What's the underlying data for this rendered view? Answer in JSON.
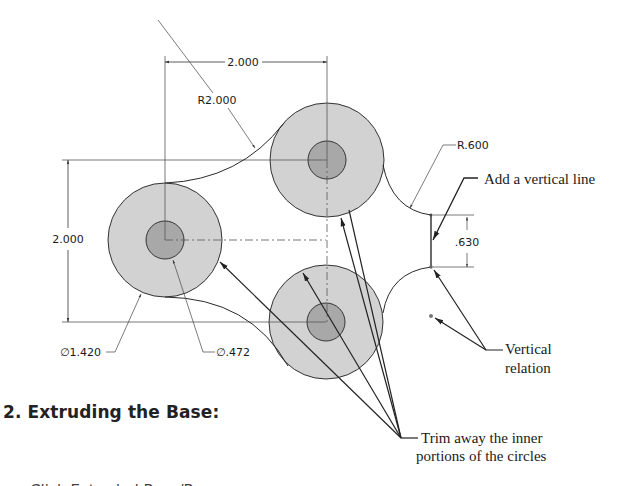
{
  "drawing": {
    "dimensions": {
      "horizontal_spacing": "2.000",
      "vertical_spacing": "2.000",
      "arc_radius_large": "R2.000",
      "arc_radius_small": "R.600",
      "outer_diameter": "∅1.420",
      "inner_diameter": "∅.472",
      "vertical_line_length": ".630"
    },
    "callouts": {
      "add_vertical_line": "Add a vertical line",
      "vertical_relation_line1": "Vertical",
      "vertical_relation_line2": "relation",
      "trim_line1": "Trim away the inner",
      "trim_line2": "portions of the circles"
    },
    "colors": {
      "outer_circle_fill": "#d2d2d2",
      "inner_circle_fill": "#a8a8a8",
      "line": "#2a2a2a"
    }
  },
  "section": {
    "heading": "2. Extruding the Base:",
    "next_line": "Click Extruded Boss/Base"
  }
}
